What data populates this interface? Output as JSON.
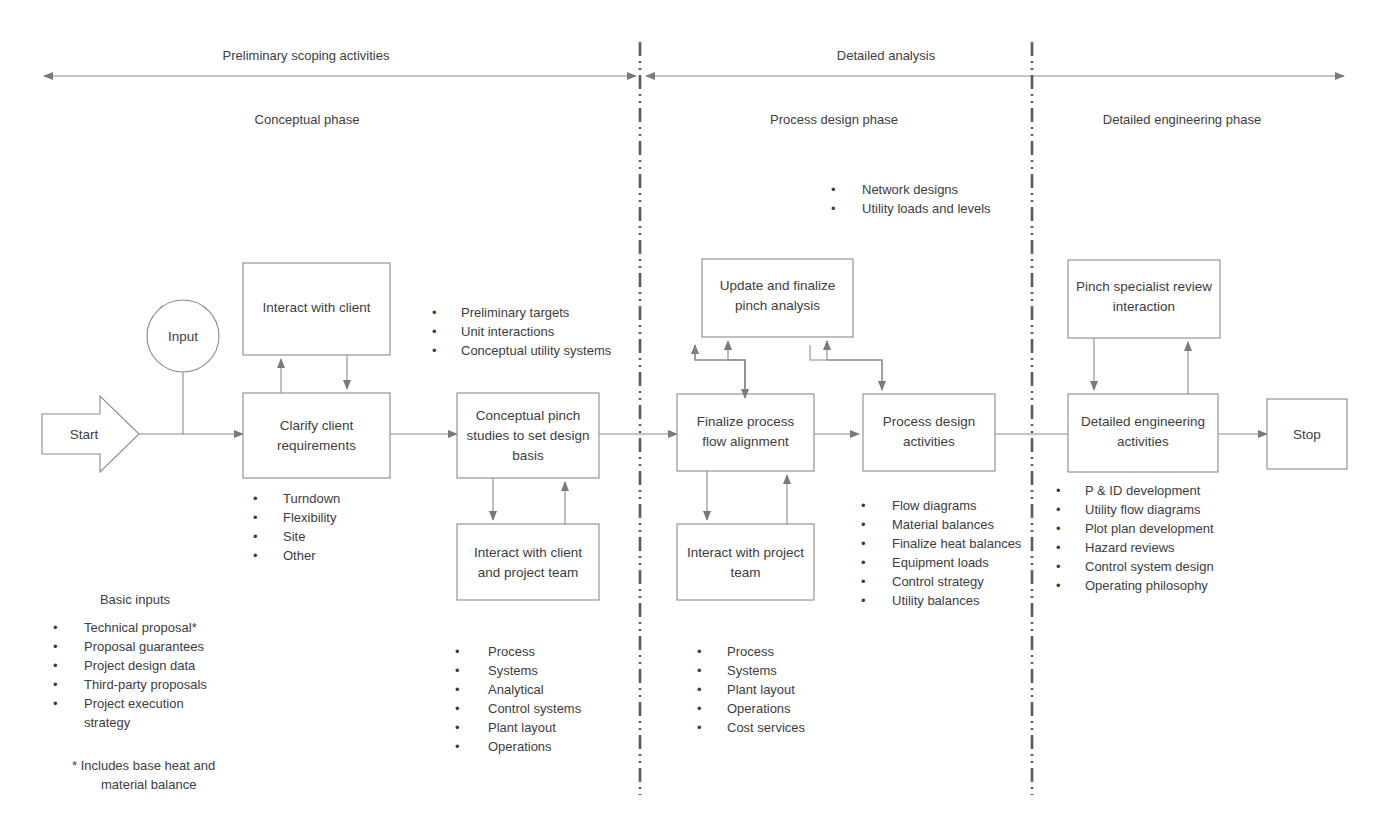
{
  "diagram": {
    "colors": {
      "stroke": "#8a8a8a",
      "divider": "#5a5a5a",
      "text": "#3d3d3d",
      "background": "#ffffff"
    }
  },
  "bands": [
    {
      "id": "band-preliminary",
      "label": "Preliminary scoping activities"
    },
    {
      "id": "band-detailed",
      "label": "Detailed analysis"
    }
  ],
  "phases": [
    {
      "id": "phase-conceptual",
      "label": "Conceptual phase"
    },
    {
      "id": "phase-process-design",
      "label": "Process design phase"
    },
    {
      "id": "phase-detailed-engineering",
      "label": "Detailed engineering phase"
    }
  ],
  "nodes": {
    "start": {
      "label": "Start"
    },
    "input": {
      "label": "Input"
    },
    "interact_client": {
      "label_line1": "Interact with client"
    },
    "clarify_client": {
      "label_line1": "Clarify client",
      "label_line2": "requirements"
    },
    "conceptual_pinch": {
      "label_line1": "Conceptual pinch",
      "label_line2": "studies to set design",
      "label_line3": "basis"
    },
    "interact_client_team": {
      "label_line1": "Interact with client",
      "label_line2": "and project team"
    },
    "update_pinch": {
      "label_line1": "Update and finalize",
      "label_line2": "pinch analysis"
    },
    "finalize_flow": {
      "label_line1": "Finalize process",
      "label_line2": "flow alignment"
    },
    "interact_project_team": {
      "label_line1": "Interact with project",
      "label_line2": "team"
    },
    "process_design": {
      "label_line1": "Process design",
      "label_line2": "activities"
    },
    "pinch_review": {
      "label_line1": "Pinch specialist review",
      "label_line2": "interaction"
    },
    "detailed_eng": {
      "label_line1": "Detailed engineering",
      "label_line2": "activities"
    },
    "stop": {
      "label": "Stop"
    }
  },
  "bullet_groups": {
    "conceptual_outputs": {
      "id": "bullets-conceptual-outputs",
      "items": [
        "Preliminary targets",
        "Unit interactions",
        "Conceptual utility systems"
      ]
    },
    "clarify_aspects": {
      "id": "bullets-clarify-aspects",
      "items": [
        "Turndown",
        "Flexibility",
        "Site",
        "Other"
      ]
    },
    "basic_inputs": {
      "id": "bullets-basic-inputs",
      "heading": "Basic inputs",
      "items": [
        "Technical proposal*",
        "Proposal guarantees",
        "Project design data",
        "Third-party proposals",
        "Project execution",
        "strategy"
      ],
      "footnote_line1": "* Includes base heat and",
      "footnote_line2": "material balance"
    },
    "conceptual_disciplines": {
      "id": "bullets-conceptual-disciplines",
      "items": [
        "Process",
        "Systems",
        "Analytical",
        "Control systems",
        "Plant layout",
        "Operations"
      ]
    },
    "network_outputs": {
      "id": "bullets-network-outputs",
      "items": [
        "Network designs",
        "Utility loads and levels"
      ]
    },
    "process_design_outputs": {
      "id": "bullets-process-design-outputs",
      "items": [
        "Flow diagrams",
        "Material balances",
        "Finalize heat balances",
        "Equipment loads",
        "Control strategy",
        "Utility balances"
      ]
    },
    "process_design_disciplines": {
      "id": "bullets-process-design-disciplines",
      "items": [
        "Process",
        "Systems",
        "Plant layout",
        "Operations",
        "Cost services"
      ]
    },
    "detailed_eng_outputs": {
      "id": "bullets-detailed-eng-outputs",
      "items": [
        "P & ID development",
        "Utility flow diagrams",
        "Plot plan development",
        "Hazard reviews",
        "Control system design",
        "Operating philosophy"
      ]
    }
  }
}
